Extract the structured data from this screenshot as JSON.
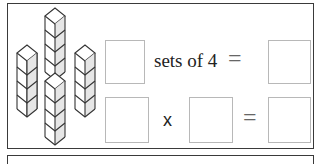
{
  "worksheet": {
    "illustration": {
      "type": "cube-towers",
      "tower_count": 4,
      "cubes_per_tower": 4
    },
    "row1": {
      "answer_box_left": "",
      "text": "sets of 4",
      "equals": "=",
      "answer_box_right": ""
    },
    "row2": {
      "answer_box_1": "",
      "operator": "x",
      "answer_box_2": "",
      "equals": "=",
      "answer_box_3": ""
    }
  }
}
